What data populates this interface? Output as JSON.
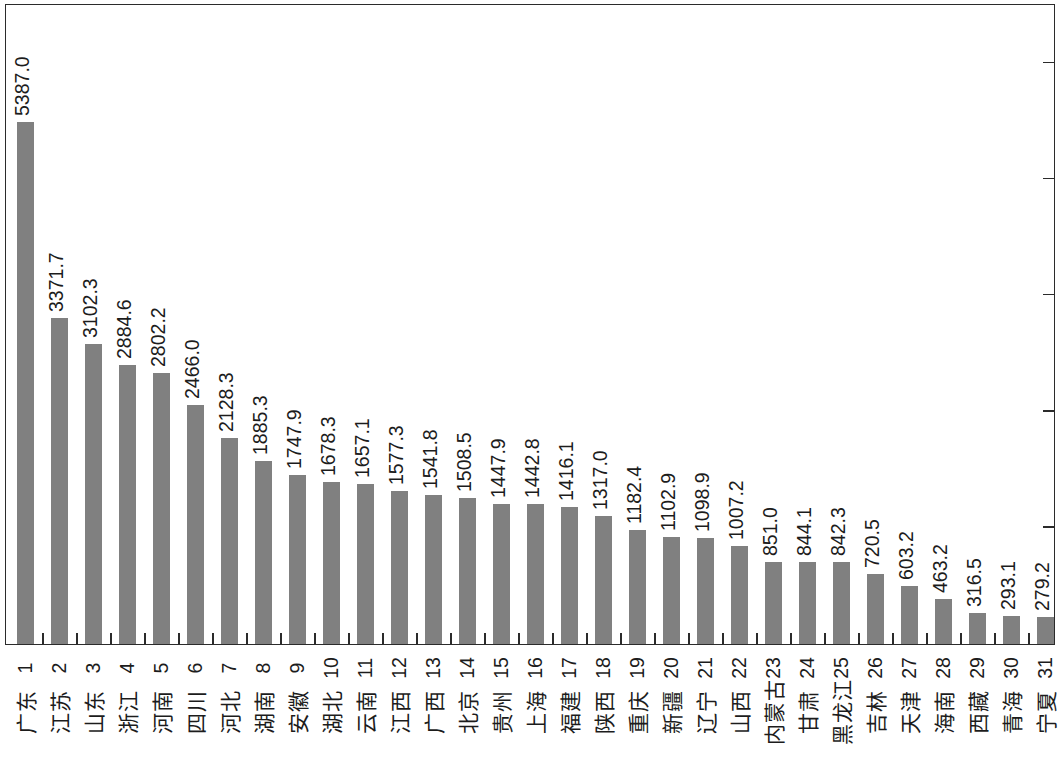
{
  "chart_data": {
    "type": "bar",
    "title": "",
    "subtitle": "",
    "xlabel": "",
    "ylabel": "",
    "orientation": "vertical-bars-rotated-canvas",
    "grid": false,
    "legend": "none",
    "ylim": [
      0,
      6000
    ],
    "y_tick_count": 5,
    "bar_color": "#808080",
    "axis_color": "#2b2b2b",
    "label_color": "#1c1c1c",
    "ranks": [
      "1",
      "2",
      "3",
      "4",
      "5",
      "6",
      "7",
      "8",
      "9",
      "10",
      "11",
      "12",
      "13",
      "14",
      "15",
      "16",
      "17",
      "18",
      "19",
      "20",
      "21",
      "22",
      "23",
      "24",
      "25",
      "26",
      "27",
      "28",
      "29",
      "30",
      "31"
    ],
    "categories": [
      "广东",
      "江苏",
      "山东",
      "浙江",
      "河南",
      "四川",
      "河北",
      "湖南",
      "安徽",
      "湖北",
      "云南",
      "江西",
      "广西",
      "北京",
      "贵州",
      "上海",
      "福建",
      "陕西",
      "重庆",
      "新疆",
      "辽宁",
      "山西",
      "内蒙古",
      "甘肃",
      "黑龙江",
      "吉林",
      "天津",
      "海南",
      "西藏",
      "青海",
      "宁夏"
    ],
    "values": [
      5387.0,
      3371.7,
      3102.3,
      2884.6,
      2802.2,
      2466.0,
      2128.3,
      1885.3,
      1747.9,
      1678.3,
      1657.1,
      1577.3,
      1541.8,
      1508.5,
      1447.9,
      1442.8,
      1416.1,
      1317.0,
      1182.4,
      1102.9,
      1098.9,
      1007.2,
      851.0,
      844.1,
      842.3,
      720.5,
      603.2,
      463.2,
      316.5,
      293.1,
      279.2
    ],
    "value_labels": [
      "5387.0",
      "3371.7",
      "3102.3",
      "2884.6",
      "2802.2",
      "2466.0",
      "2128.3",
      "1885.3",
      "1747.9",
      "1678.3",
      "1657.1",
      "1577.3",
      "1541.8",
      "1508.5",
      "1447.9",
      "1442.8",
      "1416.1",
      "1317.0",
      "1182.4",
      "1102.9",
      "1098.9",
      "1007.2",
      "851.0",
      "844.1",
      "842.3",
      "720.5",
      "603.2",
      "463.2",
      "316.5",
      "293.1",
      "279.2"
    ]
  }
}
